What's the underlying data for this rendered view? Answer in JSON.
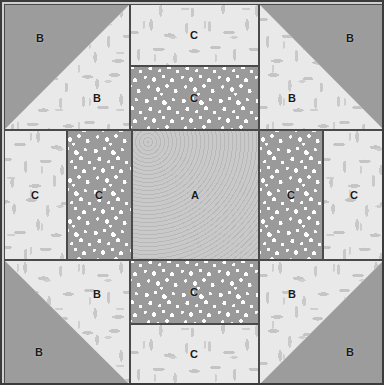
{
  "block": {
    "title": "Quilt Block Piecing Diagram",
    "size": {
      "width": 384,
      "height": 385
    },
    "border_color": "#3b3b3b",
    "seam_line_color": "#4a4a4a"
  },
  "fabrics": [
    {
      "key": "A",
      "name": "swirl-print",
      "color": "#c6c6c6",
      "description": "light grey swirl / ripple print"
    },
    {
      "key": "B",
      "name": "solid-grey",
      "color": "#9c9c9c",
      "description": "medium grey solid"
    },
    {
      "key": "B2",
      "name": "floral-light",
      "color": "#e9e9e9",
      "description": "off-white sprig / vine floral"
    },
    {
      "key": "C",
      "name": "dot-print",
      "color": "#9a9a9a",
      "description": "white dots on medium grey"
    }
  ],
  "labels": {
    "a": "A",
    "b": "B",
    "c": "C"
  },
  "patches": [
    {
      "id": "tl-hst",
      "label": "B",
      "fabric": "solid-grey",
      "row": "top",
      "col": "left"
    },
    {
      "id": "tl-hst-tri",
      "label": "B",
      "fabric": "floral-light",
      "row": "top",
      "col": "left"
    },
    {
      "id": "tm-floral",
      "label": "C",
      "fabric": "floral-light",
      "row": "top",
      "col": "center"
    },
    {
      "id": "tm-dot",
      "label": "C",
      "fabric": "dot-print",
      "row": "top",
      "col": "center"
    },
    {
      "id": "tr-hst",
      "label": "B",
      "fabric": "solid-grey",
      "row": "top",
      "col": "right"
    },
    {
      "id": "tr-hst-tri",
      "label": "B",
      "fabric": "floral-light",
      "row": "top",
      "col": "right"
    },
    {
      "id": "ml-floral",
      "label": "C",
      "fabric": "floral-light",
      "row": "middle",
      "col": "left"
    },
    {
      "id": "ml-dot",
      "label": "C",
      "fabric": "dot-print",
      "row": "middle",
      "col": "left"
    },
    {
      "id": "center-a",
      "label": "A",
      "fabric": "swirl-print",
      "row": "middle",
      "col": "center"
    },
    {
      "id": "mr-dot",
      "label": "C",
      "fabric": "dot-print",
      "row": "middle",
      "col": "right"
    },
    {
      "id": "mr-floral",
      "label": "C",
      "fabric": "floral-light",
      "row": "middle",
      "col": "right"
    },
    {
      "id": "bl-hst",
      "label": "B",
      "fabric": "solid-grey",
      "row": "bottom",
      "col": "left"
    },
    {
      "id": "bl-hst-tri",
      "label": "B",
      "fabric": "floral-light",
      "row": "bottom",
      "col": "left"
    },
    {
      "id": "bm-dot",
      "label": "C",
      "fabric": "dot-print",
      "row": "bottom",
      "col": "center"
    },
    {
      "id": "bm-floral",
      "label": "C",
      "fabric": "floral-light",
      "row": "bottom",
      "col": "center"
    },
    {
      "id": "br-hst",
      "label": "B",
      "fabric": "solid-grey",
      "row": "bottom",
      "col": "right"
    },
    {
      "id": "br-hst-tri",
      "label": "B",
      "fabric": "floral-light",
      "row": "bottom",
      "col": "right"
    }
  ]
}
